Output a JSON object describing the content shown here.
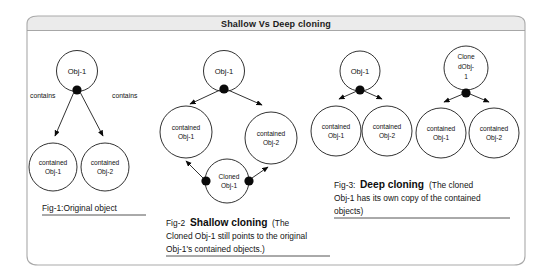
{
  "title": "Shallow Vs Deep cloning",
  "figures": [
    {
      "id": "fig1",
      "caption_prefix": "Fig-1:Original object",
      "caption_bold": "",
      "caption_rest": "",
      "nodes": {
        "root": "Obj-1",
        "child_left_line1": "contained",
        "child_left_line2": "Obj-1",
        "child_right_line1": "contained",
        "child_right_line2": "Obj-2"
      },
      "edge_labels": {
        "left": "contains",
        "right": "contains"
      }
    },
    {
      "id": "fig2",
      "caption_prefix": "Fig-2",
      "caption_bold": "Shallow cloning",
      "caption_rest_line1": "(The",
      "caption_line2": "Cloned Obj-1 still points to the original",
      "caption_line3": "Obj-1's contained objects.)",
      "nodes": {
        "root": "Obj-1",
        "child_left_line1": "contained",
        "child_left_line2": "Obj-1",
        "child_right_line1": "contained",
        "child_right_line2": "Obj-2",
        "clone_line1": "Cloned",
        "clone_line2": "Obj-1"
      }
    },
    {
      "id": "fig3",
      "caption_prefix": "Fig-3:",
      "caption_bold": "Deep cloning",
      "caption_rest_line1": "(The cloned",
      "caption_line2": "Obj-1 has its own copy of the contained",
      "caption_line3": "objects)",
      "original": {
        "root": "Obj-1",
        "child_left_line1": "contained",
        "child_left_line2": "Obj-1",
        "child_right_line1": "contained",
        "child_right_line2": "Obj-2"
      },
      "clone": {
        "root_line1": "Clone",
        "root_line2": "dObj-",
        "root_line3": "1",
        "child_left_line1": "contained",
        "child_left_line2": "Obj-1",
        "child_right_line1": "contained",
        "child_right_line2": "Obj-2"
      }
    }
  ],
  "colors": {
    "stroke": "#1b1b1b",
    "frame": "#a9a9a9",
    "titlebar": "#ebebeb",
    "background": "#ffffff"
  }
}
